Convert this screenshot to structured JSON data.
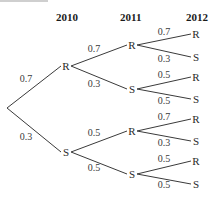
{
  "headers": [
    "2010",
    "2011",
    "2012"
  ],
  "root": {
    "x": 7,
    "y": 108
  },
  "level1": [
    {
      "label": "R",
      "x": 66,
      "y": 66,
      "prob": "0.7",
      "prob_x": 26,
      "prob_y": 82
    },
    {
      "label": "S",
      "x": 66,
      "y": 152,
      "prob": "0.3",
      "prob_x": 26,
      "prob_y": 140
    }
  ],
  "level2": [
    {
      "label": "R",
      "x": 132,
      "y": 45,
      "prob": "0.7",
      "prob_x": 94,
      "prob_y": 52
    },
    {
      "label": "S",
      "x": 132,
      "y": 89,
      "prob": "0.3",
      "prob_x": 94,
      "prob_y": 87
    },
    {
      "label": "R",
      "x": 132,
      "y": 131,
      "prob": "0.5",
      "prob_x": 94,
      "prob_y": 136
    },
    {
      "label": "S",
      "x": 132,
      "y": 174,
      "prob": "0.5",
      "prob_x": 94,
      "prob_y": 171
    }
  ],
  "level3": [
    {
      "label": "R",
      "x": 196,
      "y": 34,
      "prob": "0.7",
      "prob_x": 164,
      "prob_y": 35
    },
    {
      "label": "S",
      "x": 196,
      "y": 57,
      "prob": "0.3",
      "prob_x": 164,
      "prob_y": 62
    },
    {
      "label": "R",
      "x": 196,
      "y": 77,
      "prob": "0.5",
      "prob_x": 164,
      "prob_y": 78
    },
    {
      "label": "S",
      "x": 196,
      "y": 99,
      "prob": "0.5",
      "prob_x": 164,
      "prob_y": 104
    },
    {
      "label": "R",
      "x": 196,
      "y": 119,
      "prob": "0.7",
      "prob_x": 164,
      "prob_y": 120
    },
    {
      "label": "S",
      "x": 196,
      "y": 141,
      "prob": "0.3",
      "prob_x": 164,
      "prob_y": 146
    },
    {
      "label": "R",
      "x": 196,
      "y": 161,
      "prob": "0.5",
      "prob_x": 164,
      "prob_y": 162
    },
    {
      "label": "S",
      "x": 196,
      "y": 184,
      "prob": "0.5",
      "prob_x": 164,
      "prob_y": 188
    }
  ]
}
